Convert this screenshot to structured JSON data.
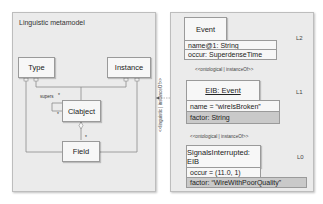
{
  "linguistic_panel": {
    "title": "Linguistic metamodel",
    "classes": {
      "type": "Type",
      "instance": "Instance",
      "clabject": "Clabject",
      "field": "Field"
    },
    "supers_label": "supers",
    "multiplicities": {
      "supers_top": "*",
      "supers_bottom": "*",
      "field": "*"
    }
  },
  "linguistic_relation": "<<linguistic | instanceOf>>",
  "ontological_panel": {
    "levels": [
      {
        "label": "L2",
        "class_header": "Event",
        "attributes": [
          {
            "text": "name@1: String",
            "shaded": false
          },
          {
            "text": "occur: SuperdenseTime",
            "shaded": false
          }
        ]
      },
      {
        "label": "L1",
        "class_header": "EIB: Event",
        "attributes": [
          {
            "text": "name = “wireIsBroken”",
            "shaded": false
          },
          {
            "text": "factor: String",
            "shaded": true
          }
        ]
      },
      {
        "label": "L0",
        "class_header": "SignalsInterrupted: EIB",
        "attributes": [
          {
            "text": "occur = (11.0, 1)",
            "shaded": false
          },
          {
            "text": "factor:  “WireWithPoorQuality”",
            "shaded": true
          }
        ]
      }
    ],
    "relations": [
      "<<ontological | instanceOf>>",
      "<<ontological | instanceOf>>"
    ]
  }
}
